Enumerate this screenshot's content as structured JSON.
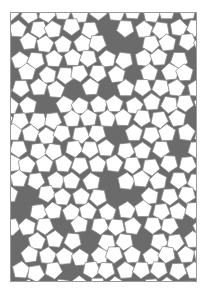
{
  "figure": {
    "type": "penrose-pentagon-tiling",
    "tiles": [
      "pentagon",
      "star",
      "boat",
      "diamond"
    ],
    "colors": {
      "pentagon_fill": "#ffffff",
      "gap_fill": "#6b6b6b",
      "edge": "#8a8a8a",
      "frame": "#9a9a9a",
      "background": "#ffffff"
    }
  }
}
